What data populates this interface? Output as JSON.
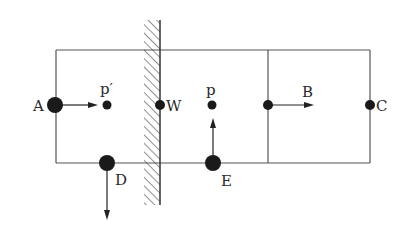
{
  "diagram": {
    "type": "mechanism-schematic",
    "colors": {
      "line": "#555555",
      "dot": "#1a1a1a",
      "text": "#2a2a2a",
      "hatch": "#444444"
    },
    "frame": {
      "left": 56,
      "top": 50,
      "right": 370,
      "bottom": 163,
      "divider_x": 268
    },
    "wall": {
      "x": 160,
      "top": 20,
      "bottom": 205,
      "hatch_width": 16
    },
    "points": [
      {
        "id": "A",
        "label": "A",
        "x": 55,
        "y": 105,
        "r": 8,
        "arrow": "right",
        "arrow_to": [
          95,
          105
        ]
      },
      {
        "id": "p_prime",
        "label": "p′",
        "x": 107,
        "y": 105,
        "r": 4.5
      },
      {
        "id": "W",
        "label": "W",
        "x": 160,
        "y": 105,
        "r": 5
      },
      {
        "id": "p",
        "label": "p",
        "x": 212,
        "y": 105,
        "r": 4.5
      },
      {
        "id": "B",
        "label": "B",
        "x": 268,
        "y": 105,
        "r": 5,
        "arrow": "right",
        "arrow_to": [
          312,
          105
        ]
      },
      {
        "id": "C",
        "label": "C",
        "x": 370,
        "y": 105,
        "r": 5
      },
      {
        "id": "D",
        "label": "D",
        "x": 107,
        "y": 163,
        "r": 8,
        "arrow": "down",
        "arrow_to": [
          107,
          220
        ]
      },
      {
        "id": "E",
        "label": "E",
        "x": 213,
        "y": 163,
        "r": 8,
        "arrow": "up",
        "arrow_to": [
          213,
          118
        ]
      }
    ]
  }
}
